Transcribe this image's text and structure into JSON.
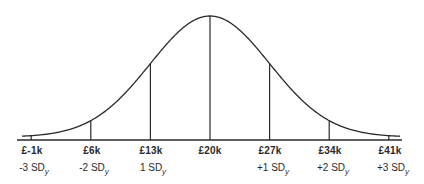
{
  "chart_data": {
    "type": "line",
    "title": "",
    "xlabel": "",
    "ylabel": "",
    "grid": false,
    "legend": null,
    "mean": 20,
    "sd": 7,
    "unit": "£k",
    "ticks": [
      {
        "value": -1,
        "label": "£-1k",
        "sd_label": "-3 SD",
        "sd_sub": "y"
      },
      {
        "value": 6,
        "label": "£6k",
        "sd_label": "-2 SD",
        "sd_sub": "y"
      },
      {
        "value": 13,
        "label": "£13k",
        "sd_label": "1 SD",
        "sd_sub": "y"
      },
      {
        "value": 20,
        "label": "£20k",
        "sd_label": "",
        "sd_sub": ""
      },
      {
        "value": 27,
        "label": "£27k",
        "sd_label": "+1 SD",
        "sd_sub": "y"
      },
      {
        "value": 34,
        "label": "£34k",
        "sd_label": "+2 SD",
        "sd_sub": "y"
      },
      {
        "value": 41,
        "label": "£41k",
        "sd_label": "+3 SD",
        "sd_sub": "y"
      }
    ]
  },
  "labels": {
    "t0": "£-1k",
    "t1": "£6k",
    "t2": "£13k",
    "t3": "£20k",
    "t4": "£27k",
    "t5": "£34k",
    "t6": "£41k",
    "s0": "-3 SD",
    "s1": "-2 SD",
    "s2": "1 SD",
    "s4": "+1 SD",
    "s5": "+2 SD",
    "s6": "+3 SD",
    "sub": "y"
  },
  "colors": {
    "line": "#2a2a2a",
    "background": "#ffffff"
  }
}
